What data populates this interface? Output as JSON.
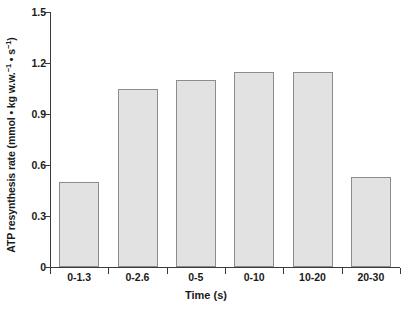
{
  "chart_data": {
    "type": "bar",
    "title": "",
    "categories": [
      "0-1.3",
      "0-2.6",
      "0-5",
      "0-10",
      "10-20",
      "20-30"
    ],
    "values": [
      0.5,
      1.05,
      1.1,
      1.15,
      1.15,
      0.53
    ],
    "xlabel": "Time (s)",
    "ylabel_parts": {
      "main": "ATP resynthesis rate (mmol • kg w.w.",
      "sup1": "−1",
      "mid": " • s",
      "sup2": "−1",
      "tail": ")"
    },
    "ylabel_plain": "ATP resynthesis rate (mmol • kg w.w.⁻¹ • s⁻¹)",
    "ylim": [
      0,
      1.5
    ],
    "yticks": [
      "0",
      "0.3",
      "0.6",
      "0.9",
      "1.2",
      "1.5"
    ],
    "ytick_values": [
      0,
      0.3,
      0.6,
      0.9,
      1.2,
      1.5
    ],
    "grid": false,
    "legend": "none",
    "bar_fill_color": "#e2e2e2",
    "bar_border_color": "#8c8c8c",
    "axis_color": "#3a3a3a"
  }
}
